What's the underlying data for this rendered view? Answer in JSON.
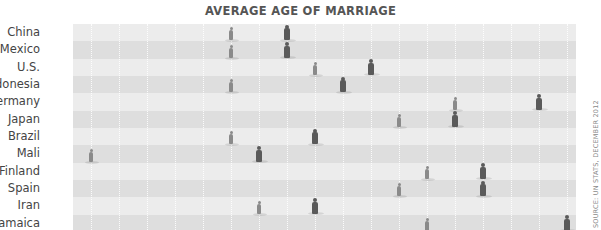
{
  "chart_data": {
    "type": "scatter",
    "title": "AVERAGE AGE OF MARRIAGE",
    "source": "SOURCE: UN STATS, DECEMBER 2012",
    "xlabel": "",
    "ylabel": "",
    "x_range": [
      15.3,
      33.3
    ],
    "grid": "vertical dotted lines every 1 year",
    "legend": "female figure (lighter, smaller) / male figure (darker, larger)",
    "categories": [
      "China",
      "Mexico",
      "U.S.",
      "Indonesia",
      "Germany",
      "Japan",
      "Brazil",
      "Mali",
      "Finland",
      "Spain",
      "Iran",
      "Jamaica"
    ],
    "series": [
      {
        "name": "Women",
        "values": [
          21,
          21,
          24,
          21,
          29,
          27,
          21,
          16,
          28,
          27,
          22,
          28
        ]
      },
      {
        "name": "Men",
        "values": [
          23,
          23,
          26,
          25,
          32,
          29,
          24,
          22,
          30,
          30,
          24,
          33
        ]
      }
    ]
  },
  "title": "AVERAGE AGE OF MARRIAGE",
  "source": "SOURCE: UN STATS, DECEMBER 2012",
  "rows": [
    {
      "label": "China"
    },
    {
      "label": "Mexico"
    },
    {
      "label": "U.S."
    },
    {
      "label": "Indonesia"
    },
    {
      "label": "Germany"
    },
    {
      "label": "Japan"
    },
    {
      "label": "Brazil"
    },
    {
      "label": "Mali"
    },
    {
      "label": "Finland"
    },
    {
      "label": "Spain"
    },
    {
      "label": "Iran"
    },
    {
      "label": "Jamaica"
    }
  ],
  "colors": {
    "band_light": "#ececec",
    "band_dark": "#dedede",
    "female": "#8a8a8a",
    "male": "#5a5a5a",
    "title": "#555555"
  }
}
